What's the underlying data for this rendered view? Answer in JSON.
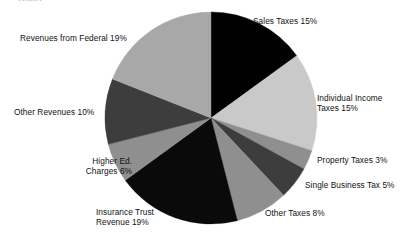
{
  "title_fragment": "Chart",
  "chart_data": {
    "type": "pie",
    "title": "",
    "xlabel": "",
    "ylabel": "",
    "start_angle_deg": 0,
    "direction": "clockwise",
    "center": {
      "x": 211,
      "y": 118
    },
    "radius": 106,
    "legend": "none",
    "grid": false,
    "labels_placement": "outside-callout-text",
    "categories": [
      "Sales Taxes",
      "Individual Income Taxes",
      "Property Taxes",
      "Single Business Tax",
      "Other Taxes",
      "Insurance Trust Revenue",
      "Higher Ed. Charges",
      "Other Revenues",
      "Revenues from Federal"
    ],
    "values": [
      15,
      15,
      3,
      5,
      8,
      19,
      6,
      10,
      19
    ],
    "unit": "%",
    "colors": [
      "#000000",
      "#c9c9c9",
      "#8f8f8f",
      "#3d3d3d",
      "#8f8f8f",
      "#0a0a0a",
      "#8f8f8f",
      "#3d3d3d",
      "#a8a8a8"
    ],
    "slices": [
      {
        "name": "Sales Taxes",
        "value": 15,
        "color": "#000000",
        "label": "Sales Taxes 15%"
      },
      {
        "name": "Individual Income Taxes",
        "value": 15,
        "color": "#c9c9c9",
        "label": "Individual Income\nTaxes 15%"
      },
      {
        "name": "Property Taxes",
        "value": 3,
        "color": "#8f8f8f",
        "label": "Property Taxes 3%"
      },
      {
        "name": "Single Business Tax",
        "value": 5,
        "color": "#3d3d3d",
        "label": "Single Business Tax 5%"
      },
      {
        "name": "Other Taxes",
        "value": 8,
        "color": "#8f8f8f",
        "label": "Other Taxes 8%"
      },
      {
        "name": "Insurance Trust Revenue",
        "value": 19,
        "color": "#0a0a0a",
        "label": "Insurance Trust\nRevenue 19%"
      },
      {
        "name": "Higher Ed. Charges",
        "value": 6,
        "color": "#8f8f8f",
        "label": "Higher Ed.\nCharges 6%"
      },
      {
        "name": "Other Revenues",
        "value": 10,
        "color": "#3d3d3d",
        "label": "Other Revenues 10%"
      },
      {
        "name": "Revenues from Federal",
        "value": 19,
        "color": "#a8a8a8",
        "label": "Revenues from Federal 19%"
      }
    ]
  },
  "labels": {
    "sales_taxes": "Sales Taxes 15%",
    "individual_income_taxes": "Individual Income\nTaxes 15%",
    "property_taxes": "Property Taxes 3%",
    "single_business_tax": "Single Business Tax 5%",
    "other_taxes": "Other Taxes 8%",
    "insurance_trust_revenue": "Insurance Trust\nRevenue 19%",
    "higher_ed_charges": "Higher Ed.\nCharges 6%",
    "other_revenues": "Other Revenues 10%",
    "revenues_from_federal": "Revenues from Federal 19%"
  }
}
